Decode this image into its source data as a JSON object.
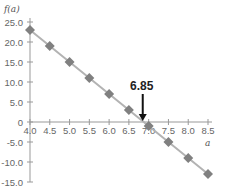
{
  "chart_data": {
    "type": "line",
    "title": "",
    "xlabel": "a",
    "ylabel": "f(a)",
    "x": [
      4.0,
      4.5,
      5.0,
      5.5,
      6.0,
      6.5,
      7.0,
      7.5,
      8.0,
      8.5
    ],
    "series": [
      {
        "name": "f(a)",
        "values": [
          23,
          19,
          15,
          11,
          7,
          3,
          -1,
          -5,
          -9,
          -13
        ],
        "color": "#808080",
        "line_color": "#b3b3b3",
        "marker": "diamond"
      }
    ],
    "xlim": [
      4.0,
      8.5
    ],
    "ylim": [
      -15,
      25
    ],
    "x_ticks": [
      4.0,
      4.5,
      5.0,
      5.5,
      6.0,
      6.5,
      7.0,
      7.5,
      8.0,
      8.5
    ],
    "x_tick_labels": [
      "4.0",
      "4.5",
      "5.0",
      "5.5",
      "6.0",
      "6.5",
      "7.0",
      "7.5",
      "8.0",
      "8.5"
    ],
    "y_ticks": [
      25,
      20,
      15,
      10,
      5,
      0,
      -5,
      -10,
      -15
    ],
    "y_tick_labels": [
      "25.0",
      "20.0",
      "15.0",
      "10.0",
      "5.0",
      "0",
      "-5.0",
      "-10.0",
      "-15.0"
    ],
    "grid": false,
    "legend": "none",
    "annotations": [
      {
        "text": "6.85",
        "x": 6.85,
        "y": 0,
        "arrow": "down"
      }
    ]
  }
}
